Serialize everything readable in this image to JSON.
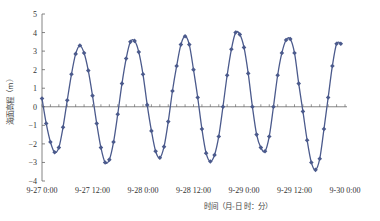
{
  "chart_data": {
    "type": "line",
    "title": "",
    "xlabel": "时间（月-日 时：分）",
    "ylabel": "海面高程（m）",
    "ylim": [
      -4,
      5
    ],
    "yticks": [
      5,
      4,
      3,
      2,
      1,
      0,
      -1,
      -2,
      -3,
      -4
    ],
    "xlim_hours": [
      0,
      72
    ],
    "xtick_labels": [
      "9-27 0:00",
      "9-27 12:00",
      "9-28 0:00",
      "9-28 12:00",
      "9-29 0:00",
      "9-29 12:00",
      "9-30 0:00"
    ],
    "xtick_hours": [
      0,
      12,
      24,
      36,
      48,
      60,
      72
    ],
    "grid": false,
    "legend": null,
    "marker": "diamond",
    "color": "#4b5a8c",
    "series": [
      {
        "name": "海面高程",
        "x_hours": [
          0,
          1,
          2,
          3,
          4,
          5,
          6,
          7,
          8,
          9,
          10,
          11,
          12,
          13,
          14,
          15,
          16,
          17,
          18,
          19,
          20,
          21,
          22,
          23,
          24,
          25,
          26,
          27,
          28,
          29,
          30,
          31,
          32,
          33,
          34,
          35,
          36,
          37,
          38,
          39,
          40,
          41,
          42,
          43,
          44,
          45,
          46,
          47,
          48,
          49,
          50,
          51,
          52,
          53,
          54,
          55,
          56,
          57,
          58,
          59,
          60,
          61,
          62,
          63,
          64,
          65,
          66,
          67,
          68,
          69,
          70,
          71
        ],
        "values": [
          0.45,
          -0.9,
          -1.9,
          -2.45,
          -2.2,
          -1.1,
          0.35,
          1.75,
          2.85,
          3.3,
          2.9,
          1.95,
          0.6,
          -0.9,
          -2.2,
          -3.0,
          -2.85,
          -1.9,
          -0.4,
          1.25,
          2.6,
          3.5,
          3.55,
          2.95,
          1.75,
          0.1,
          -1.3,
          -2.4,
          -2.75,
          -2.15,
          -0.8,
          0.85,
          2.2,
          3.35,
          3.8,
          3.35,
          2.0,
          0.5,
          -1.2,
          -2.5,
          -2.95,
          -2.6,
          -1.6,
          0.0,
          1.7,
          3.1,
          4.0,
          3.9,
          3.2,
          1.8,
          0.0,
          -1.5,
          -2.2,
          -2.4,
          -1.6,
          0.0,
          1.7,
          2.9,
          3.6,
          3.65,
          2.9,
          1.25,
          -0.25,
          -1.8,
          -3.0,
          -3.4,
          -2.8,
          -1.2,
          0.5,
          2.2,
          3.4,
          3.4
        ]
      }
    ]
  }
}
